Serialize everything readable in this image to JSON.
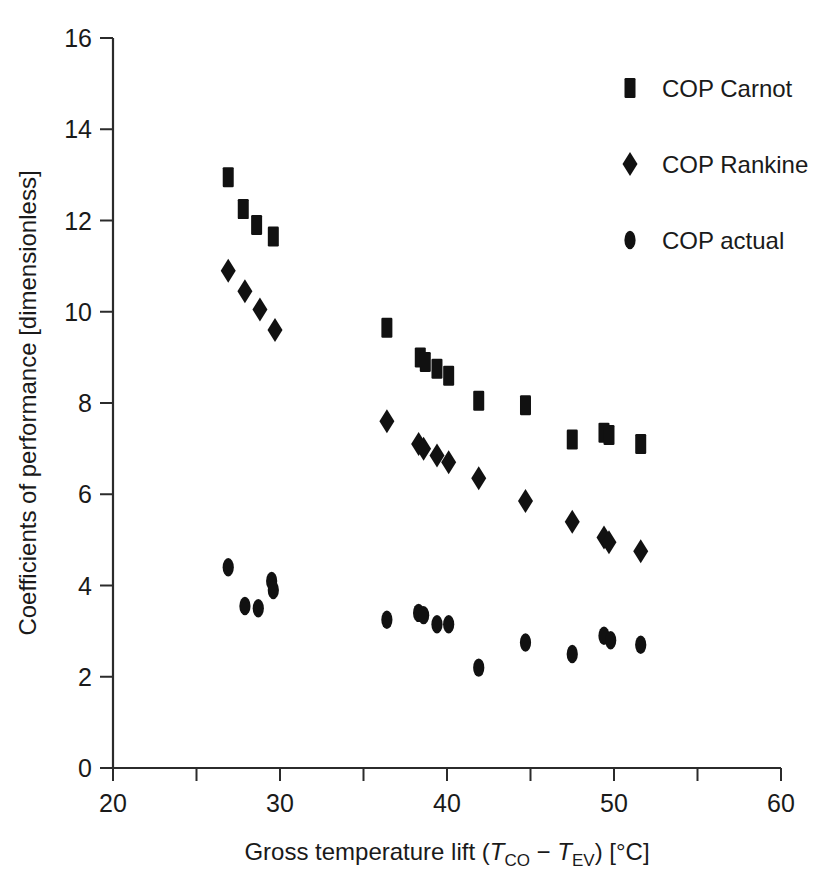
{
  "chart_data": {
    "type": "scatter",
    "title": "",
    "xlabel": "Gross temperature lift (TCO − TEV) [°C]",
    "ylabel": "Coefficients of performance [dimensionless]",
    "xlim": [
      20,
      60
    ],
    "ylim": [
      0,
      16
    ],
    "xticks": [
      20,
      30,
      40,
      50,
      60
    ],
    "xticklabels": [
      "20",
      "30",
      "40",
      "50",
      "60"
    ],
    "xticks_minor": [
      25,
      35,
      45,
      55
    ],
    "yticks": [
      0,
      2,
      4,
      6,
      8,
      10,
      12,
      14,
      16
    ],
    "yticklabels": [
      "0",
      "2",
      "4",
      "6",
      "8",
      "10",
      "12",
      "14",
      "16"
    ],
    "grid": false,
    "legend_position": "upper-right",
    "marker_color": "#111111",
    "series": [
      {
        "name": "COP Carnot",
        "marker": "square",
        "points": [
          [
            26.9,
            12.95
          ],
          [
            27.8,
            12.25
          ],
          [
            28.6,
            11.9
          ],
          [
            29.6,
            11.65
          ],
          [
            36.4,
            9.65
          ],
          [
            38.4,
            9.0
          ],
          [
            38.7,
            8.9
          ],
          [
            39.4,
            8.75
          ],
          [
            40.1,
            8.6
          ],
          [
            41.9,
            8.05
          ],
          [
            44.7,
            7.95
          ],
          [
            47.5,
            7.2
          ],
          [
            49.4,
            7.35
          ],
          [
            49.7,
            7.3
          ],
          [
            51.6,
            7.1
          ]
        ]
      },
      {
        "name": "COP Rankine",
        "marker": "diamond",
        "points": [
          [
            26.9,
            10.9
          ],
          [
            27.9,
            10.45
          ],
          [
            28.8,
            10.05
          ],
          [
            29.7,
            9.6
          ],
          [
            36.4,
            7.6
          ],
          [
            38.3,
            7.1
          ],
          [
            38.6,
            7.0
          ],
          [
            39.4,
            6.85
          ],
          [
            40.1,
            6.7
          ],
          [
            41.9,
            6.35
          ],
          [
            44.7,
            5.85
          ],
          [
            47.5,
            5.4
          ],
          [
            49.4,
            5.05
          ],
          [
            49.7,
            4.95
          ],
          [
            51.6,
            4.75
          ]
        ]
      },
      {
        "name": "COP actual",
        "marker": "ellipse",
        "points": [
          [
            26.9,
            4.4
          ],
          [
            27.9,
            3.55
          ],
          [
            28.7,
            3.5
          ],
          [
            29.5,
            4.1
          ],
          [
            29.6,
            3.9
          ],
          [
            36.4,
            3.25
          ],
          [
            38.3,
            3.4
          ],
          [
            38.6,
            3.35
          ],
          [
            39.4,
            3.15
          ],
          [
            40.1,
            3.15
          ],
          [
            41.9,
            2.2
          ],
          [
            44.7,
            2.75
          ],
          [
            47.5,
            2.5
          ],
          [
            49.4,
            2.9
          ],
          [
            49.8,
            2.8
          ],
          [
            51.6,
            2.7
          ]
        ]
      }
    ]
  },
  "legend": {
    "items": [
      {
        "label": "COP Carnot",
        "marker": "square"
      },
      {
        "label": "COP Rankine",
        "marker": "diamond"
      },
      {
        "label": "COP actual",
        "marker": "ellipse"
      }
    ]
  },
  "axes": {
    "x_title_prefix": "Gross temperature lift (",
    "x_title_t1": "T",
    "x_title_sub1": "CO",
    "x_title_minus": " − ",
    "x_title_t2": "T",
    "x_title_sub2": "EV",
    "x_title_suffix": ") [°C]",
    "y_title": "Coefficients of performance [dimensionless]"
  }
}
